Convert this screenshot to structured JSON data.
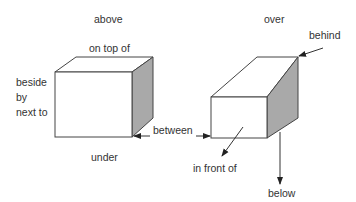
{
  "diagram": {
    "colors": {
      "stroke": "#444444",
      "side_face": "#a9a9a9",
      "face": "#ffffff",
      "text": "#333333"
    },
    "left_cube": {
      "labels": {
        "above": "above",
        "on_top_of": "on top of",
        "beside": "beside",
        "by": "by",
        "next_to": "next to",
        "under": "under"
      }
    },
    "right_cube": {
      "labels": {
        "over": "over",
        "behind": "behind",
        "in_front_of": "in front of",
        "below": "below"
      }
    },
    "between_label": "between"
  }
}
